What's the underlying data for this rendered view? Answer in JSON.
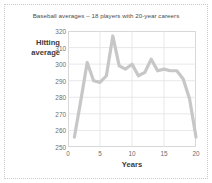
{
  "chart_data": {
    "type": "line",
    "title": "Baseball averages – 18 players with 20-year careers",
    "xlabel": "Years",
    "ylabel_line1": "Hitting",
    "ylabel_line2": "average",
    "ylabel": "Hitting average",
    "xlim": [
      0,
      20
    ],
    "ylim": [
      250,
      320
    ],
    "xticks": [
      0,
      5,
      10,
      15,
      20
    ],
    "yticks": [
      250,
      260,
      270,
      280,
      290,
      300,
      310,
      320
    ],
    "grid": true,
    "legend": "none",
    "line_color": "#c7c7c7",
    "line_width": 3.2,
    "x": [
      1,
      2,
      3,
      4,
      5,
      6,
      7,
      8,
      9,
      10,
      11,
      12,
      13,
      14,
      15,
      16,
      17,
      18,
      19,
      20
    ],
    "values": [
      256,
      278,
      301,
      290,
      289,
      293,
      317,
      299,
      297,
      300,
      293,
      295,
      303,
      296,
      297,
      296,
      296,
      291,
      279,
      256
    ],
    "series": [
      {
        "name": "Hitting average",
        "values": [
          256,
          278,
          301,
          290,
          289,
          293,
          317,
          299,
          297,
          300,
          293,
          295,
          303,
          296,
          297,
          296,
          296,
          291,
          279,
          256
        ]
      }
    ]
  },
  "figure": {
    "border_color": "#c9c9c9",
    "background": "#ffffff",
    "axis_color": "#d8d8d8",
    "grid_color": "#e2e2e2",
    "tick_text_color": "#6d6d6d",
    "title_color": "#4b4b4b"
  }
}
